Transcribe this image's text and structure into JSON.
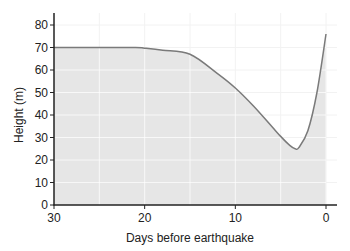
{
  "chart_data": {
    "type": "area",
    "title": "",
    "xlabel": "Days before earthquake",
    "ylabel": "Height (m)",
    "xlim": [
      30,
      0
    ],
    "ylim": [
      0,
      85
    ],
    "x_ticks": [
      30,
      20,
      10,
      0
    ],
    "y_ticks": [
      0,
      10,
      20,
      30,
      40,
      50,
      60,
      70,
      80
    ],
    "grid": true,
    "legend": null,
    "series": [
      {
        "name": "Height",
        "x": [
          30,
          25,
          21,
          20,
          18,
          15,
          12,
          10,
          8,
          6,
          5,
          4,
          3.4,
          3,
          2,
          1,
          0
        ],
        "values": [
          70,
          70,
          70,
          69.7,
          68.8,
          67,
          58.5,
          52,
          44,
          35,
          30.5,
          26.5,
          25,
          25.5,
          33,
          50,
          76
        ]
      }
    ],
    "colors": {
      "line": "#7a7a7a",
      "fill": "#e6e6e6",
      "grid": "#f2f2f2",
      "axis": "#222222"
    }
  }
}
